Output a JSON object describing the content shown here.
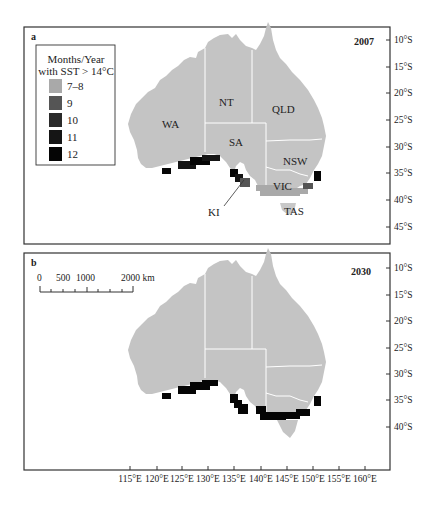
{
  "panels": [
    {
      "letter": "a",
      "year": "2007",
      "labels": {
        "wa": "WA",
        "nt": "NT",
        "qld": "QLD",
        "sa": "SA",
        "nsw": "NSW",
        "vic": "VIC",
        "tas": "TAS",
        "ki": "KI"
      }
    },
    {
      "letter": "b",
      "year": "2030",
      "scale_bar": {
        "labels": [
          "0",
          "500",
          "1000",
          "2000 km"
        ]
      }
    }
  ],
  "legend": {
    "title_line1": "Months/Year",
    "title_line2": "with SST > 14°C",
    "items": [
      {
        "label": "7–8",
        "color": "#a9a9a9"
      },
      {
        "label": "9",
        "color": "#555555"
      },
      {
        "label": "10",
        "color": "#2a2a2a"
      },
      {
        "label": "11",
        "color": "#151515"
      },
      {
        "label": "12",
        "color": "#050505"
      }
    ]
  },
  "axes": {
    "lat_a": [
      "10°S",
      "15°S",
      "20°S",
      "25°S",
      "30°S",
      "35°S",
      "40°S",
      "45°S"
    ],
    "lat_b": [
      "10°S",
      "15°S",
      "20°S",
      "25°S",
      "30°S",
      "35°S",
      "40°S"
    ],
    "lon": [
      "115°E",
      "120°E",
      "125°E",
      "130°E",
      "135°E",
      "140°E",
      "145°E",
      "150°E",
      "155°E",
      "160°E"
    ]
  },
  "colors": {
    "land": "#c4c4c4",
    "border": "#ffffff",
    "frame": "#333333"
  }
}
